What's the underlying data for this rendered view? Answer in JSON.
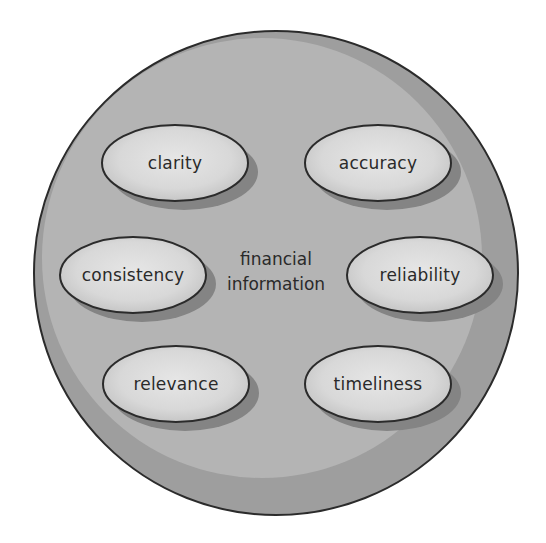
{
  "diagram": {
    "type": "concept-circle",
    "center": {
      "line1": "financial",
      "line2": "information"
    },
    "qualities": [
      {
        "label": "clarity",
        "cx": 175,
        "cy": 163,
        "position": "top-left"
      },
      {
        "label": "accuracy",
        "cx": 378,
        "cy": 163,
        "position": "top-right"
      },
      {
        "label": "consistency",
        "cx": 133,
        "cy": 275,
        "position": "middle-left"
      },
      {
        "label": "reliability",
        "cx": 420,
        "cy": 275,
        "position": "middle-right"
      },
      {
        "label": "relevance",
        "cx": 176,
        "cy": 384,
        "position": "bottom-left"
      },
      {
        "label": "timeliness",
        "cx": 378,
        "cy": 384,
        "position": "bottom-right"
      }
    ],
    "colors": {
      "outer_disk": "#9e9e9e",
      "inner_highlight": "#b6b6b6",
      "ellipse_fill": "#d2d2d2",
      "ellipse_highlight": "#e4e4e4",
      "ellipse_shadow": "#828282",
      "stroke": "#2b2b2b",
      "text": "#2a2a2a"
    }
  }
}
